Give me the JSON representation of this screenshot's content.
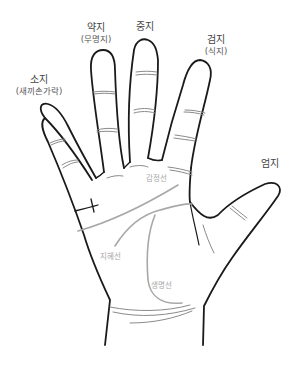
{
  "diagram": {
    "colors": {
      "outline": "#1a1a1a",
      "crease": "#8a8a8a",
      "palm_line": "#a8a8a8",
      "label_text": "#444444",
      "line_label_text": "#a8a8a8",
      "background": "#ffffff"
    },
    "fingers": [
      {
        "id": "pinky",
        "name": "소지",
        "alt_name": "(새끼손가락)"
      },
      {
        "id": "ring",
        "name": "약지",
        "alt_name": "(무명지)"
      },
      {
        "id": "middle",
        "name": "중지",
        "alt_name": ""
      },
      {
        "id": "index",
        "name": "검지",
        "alt_name": "(식지)"
      },
      {
        "id": "thumb",
        "name": "엄지",
        "alt_name": ""
      }
    ],
    "palm_lines": [
      {
        "id": "heart-line",
        "name": "감정선"
      },
      {
        "id": "head-line",
        "name": "지혜선"
      },
      {
        "id": "life-line",
        "name": "생명선"
      }
    ]
  }
}
